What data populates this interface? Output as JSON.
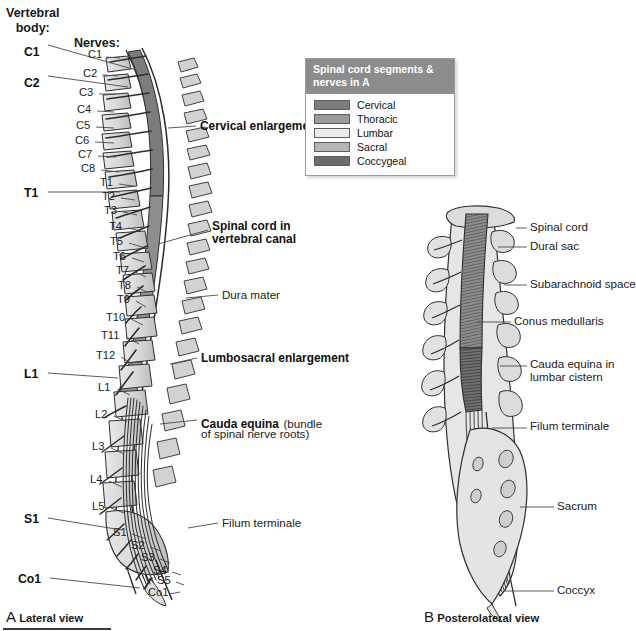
{
  "figure": {
    "headers": {
      "vertebral_body": "Vertebral\nbody:",
      "vertebral_body_line1": "Vertebral",
      "vertebral_body_line2": "body:",
      "nerves": "Nerves:"
    },
    "legend": {
      "title_line1": "Spinal cord segments &",
      "title_line2": "nerves in A",
      "title": "Spinal cord segments & nerves in A",
      "items": [
        {
          "label": "Cervical",
          "color": "#7c7c7c"
        },
        {
          "label": "Thoracic",
          "color": "#9b9b9b"
        },
        {
          "label": "Lumbar",
          "color": "#ececec"
        },
        {
          "label": "Sacral",
          "color": "#b5b5b5"
        },
        {
          "label": "Coccygeal",
          "color": "#6b6b6b"
        }
      ]
    },
    "panel_a": {
      "caption_letter": "A",
      "caption_text": "Lateral view",
      "vertebral_body_labels": [
        {
          "text": "C1",
          "x": 24,
          "y": 45
        },
        {
          "text": "C2",
          "x": 24,
          "y": 76
        },
        {
          "text": "T1",
          "x": 24,
          "y": 190
        },
        {
          "text": "L1",
          "x": 24,
          "y": 371
        },
        {
          "text": "S1",
          "x": 24,
          "y": 516
        },
        {
          "text": "Co1",
          "x": 18,
          "y": 576
        }
      ],
      "nerve_labels": [
        {
          "text": "C1",
          "x": 88,
          "y": 53
        },
        {
          "text": "C2",
          "x": 83,
          "y": 71
        },
        {
          "text": "C3",
          "x": 79,
          "y": 90
        },
        {
          "text": "C4",
          "x": 77,
          "y": 107
        },
        {
          "text": "C5",
          "x": 76,
          "y": 123
        },
        {
          "text": "C6",
          "x": 75,
          "y": 138
        },
        {
          "text": "C7",
          "x": 78,
          "y": 152
        },
        {
          "text": "C8",
          "x": 81,
          "y": 166
        },
        {
          "text": "T1",
          "x": 100,
          "y": 180
        },
        {
          "text": "T2",
          "x": 102,
          "y": 194
        },
        {
          "text": "T3",
          "x": 104,
          "y": 208
        },
        {
          "text": "T4",
          "x": 109,
          "y": 224
        },
        {
          "text": "T5",
          "x": 110,
          "y": 239
        },
        {
          "text": "T6",
          "x": 113,
          "y": 254
        },
        {
          "text": "T7",
          "x": 116,
          "y": 268
        },
        {
          "text": "T8",
          "x": 118,
          "y": 283
        },
        {
          "text": "T9",
          "x": 117,
          "y": 297
        },
        {
          "text": "T10",
          "x": 110,
          "y": 315
        },
        {
          "text": "T11",
          "x": 105,
          "y": 333
        },
        {
          "text": "T12",
          "x": 100,
          "y": 353
        },
        {
          "text": "L1",
          "x": 98,
          "y": 385
        },
        {
          "text": "L2",
          "x": 95,
          "y": 412
        },
        {
          "text": "L3",
          "x": 92,
          "y": 444
        },
        {
          "text": "L4",
          "x": 90,
          "y": 477
        },
        {
          "text": "L5",
          "x": 92,
          "y": 504
        },
        {
          "text": "S1",
          "x": 113,
          "y": 530
        },
        {
          "text": "S2",
          "x": 131,
          "y": 543
        },
        {
          "text": "S3",
          "x": 141,
          "y": 555
        },
        {
          "text": "S4",
          "x": 153,
          "y": 568
        },
        {
          "text": "S5",
          "x": 157,
          "y": 578
        },
        {
          "text": "Co1",
          "x": 148,
          "y": 590
        }
      ],
      "callouts": [
        {
          "text": "Cervical enlargement",
          "bold": true,
          "x": 200,
          "y": 124
        },
        {
          "text": "Spinal cord in",
          "bold": true,
          "x": 212,
          "y": 224
        },
        {
          "text": "vertebral canal",
          "bold": true,
          "x": 212,
          "y": 236
        },
        {
          "text": "Dura mater",
          "bold": false,
          "x": 222,
          "y": 293
        },
        {
          "text": "Lumbosacral enlargement",
          "bold": true,
          "x": 201,
          "y": 356
        },
        {
          "text": "Cauda equina",
          "bold": true,
          "x": 201,
          "y": 419
        },
        {
          "text": "(bundle",
          "bold": false,
          "x": 277,
          "y": 419
        },
        {
          "text": "of spinal nerve roots)",
          "bold": false,
          "x": 201,
          "y": 432
        },
        {
          "text": "Filum terminale",
          "bold": false,
          "x": 222,
          "y": 521
        }
      ]
    },
    "panel_b": {
      "caption_letter": "B",
      "caption_text": "Posterolateral view",
      "callouts": [
        {
          "text": "Spinal cord",
          "x": 530,
          "y": 224
        },
        {
          "text": "Dural sac",
          "x": 530,
          "y": 243
        },
        {
          "text": "Subarachnoid space",
          "x": 530,
          "y": 281
        },
        {
          "text": "Conus medullaris",
          "x": 514,
          "y": 318
        },
        {
          "text": "Cauda equina in",
          "x": 530,
          "y": 362
        },
        {
          "text": "lumbar cistern",
          "x": 530,
          "y": 375
        },
        {
          "text": "Filum terminale",
          "x": 530,
          "y": 424
        },
        {
          "text": "Sacrum",
          "x": 557,
          "y": 503
        },
        {
          "text": "Coccyx",
          "x": 557,
          "y": 587
        }
      ]
    },
    "colors": {
      "bone": "#dcdcdc",
      "bone_dark": "#c2c2c2",
      "cord_cervical": "#7c7c7c",
      "cord_thoracic": "#8e8e8e",
      "cord_lumbar": "#e4e4e4",
      "cord_sacral": "#b5b5b5",
      "cord_coccygeal": "#6b6b6b",
      "outline": "#2b2b2b",
      "leader": "#4a4a4a",
      "legend_header": "#8c8c8c"
    }
  }
}
